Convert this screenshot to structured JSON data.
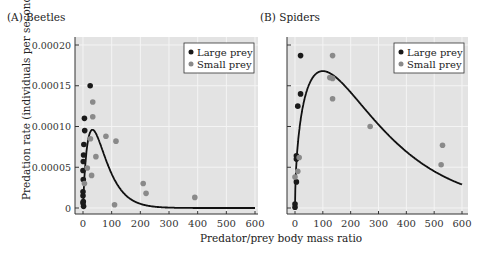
{
  "colors": {
    "plot_bg": "#e3e3e3",
    "grid": "#f4f4f4",
    "large_prey": "#1a1a1a",
    "small_prey": "#8a8a8a",
    "curve": "#111111"
  },
  "axis": {
    "ylabel": "Predation rate (individuals per second)",
    "xlabel": "Predator/prey body mass ratio"
  },
  "chart_data": [
    {
      "type": "scatter",
      "title": "(A) Beetles",
      "xlabel": "Predator/prey body mass ratio",
      "ylabel": "Predation rate (individuals per second)",
      "xlim": [
        0,
        600
      ],
      "ylim": [
        0,
        0.0002
      ],
      "xticks": [
        0,
        100,
        200,
        300,
        400,
        500,
        600
      ],
      "yticks": [
        "0",
        "0.00005",
        "0.00010",
        "0.00015",
        "0.00020"
      ],
      "grid": true,
      "legend_position": "top-right",
      "legend": [
        "Large prey",
        "Small prey"
      ],
      "series": [
        {
          "name": "Large prey",
          "points": [
            [
              25,
              0.00015
            ],
            [
              5,
              0.00011
            ],
            [
              6,
              9.5e-05
            ],
            [
              3,
              7.8e-05
            ],
            [
              2,
              6.5e-05
            ],
            [
              1,
              5.7e-05
            ],
            [
              0,
              4.6e-05
            ],
            [
              1,
              3.5e-05
            ],
            [
              0,
              2e-05
            ],
            [
              0,
              1.5e-05
            ],
            [
              0,
              6e-06
            ],
            [
              2,
              2e-06
            ],
            [
              1,
              8e-06
            ]
          ]
        },
        {
          "name": "Small prey",
          "points": [
            [
              34,
              0.00013
            ],
            [
              34,
              0.000112
            ],
            [
              26,
              8.5e-05
            ],
            [
              80,
              8.8e-05
            ],
            [
              115,
              8.2e-05
            ],
            [
              45,
              6.3e-05
            ],
            [
              15,
              4.9e-05
            ],
            [
              30,
              4e-05
            ],
            [
              5,
              3e-05
            ],
            [
              210,
              3e-05
            ],
            [
              220,
              1.8e-05
            ],
            [
              110,
              4e-06
            ],
            [
              390,
              1.3e-05
            ]
          ]
        },
        {
          "name": "Fitted curve",
          "type": "line",
          "peak_x": 33,
          "peak_y": 9.6e-05
        }
      ]
    },
    {
      "type": "scatter",
      "title": "(B) Spiders",
      "xlabel": "Predator/prey body mass ratio",
      "xlim": [
        0,
        600
      ],
      "ylim": [
        0,
        0.0002
      ],
      "xticks": [
        0,
        100,
        200,
        300,
        400,
        500,
        600
      ],
      "grid": true,
      "legend_position": "top-right",
      "legend": [
        "Large prey",
        "Small prey"
      ],
      "series": [
        {
          "name": "Large prey",
          "points": [
            [
              20,
              0.000187
            ],
            [
              20,
              0.00014
            ],
            [
              10,
              0.000125
            ],
            [
              5,
              6.4e-05
            ],
            [
              5,
              6e-05
            ],
            [
              5,
              3.2e-05
            ],
            [
              0,
              5e-06
            ],
            [
              0,
              1e-06
            ]
          ]
        },
        {
          "name": "Small prey",
          "points": [
            [
              135,
              0.000187
            ],
            [
              125,
              0.00016
            ],
            [
              135,
              0.000159
            ],
            [
              135,
              0.000134
            ],
            [
              270,
              0.0001
            ],
            [
              530,
              7.7e-05
            ],
            [
              525,
              5.3e-05
            ],
            [
              15,
              6.2e-05
            ],
            [
              10,
              4.5e-05
            ],
            [
              0,
              3.8e-05
            ]
          ]
        },
        {
          "name": "Fitted curve",
          "type": "line",
          "peak_x": 100,
          "peak_y": 0.000168
        }
      ]
    }
  ]
}
